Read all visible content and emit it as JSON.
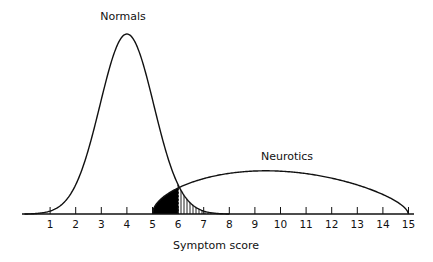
{
  "chart_data": {
    "type": "line",
    "title": "",
    "xlabel": "Symptom score",
    "ylabel": "",
    "xlim": [
      -1,
      15.2
    ],
    "ylim": [
      0,
      1
    ],
    "grid": false,
    "x_ticks": [
      1,
      2,
      3,
      4,
      5,
      6,
      7,
      8,
      9,
      10,
      11,
      12,
      13,
      14,
      15
    ],
    "x_tick_labels": [
      "1",
      "2",
      "3",
      "4",
      "5",
      "6",
      "7",
      "8",
      "9",
      "10",
      "11",
      "12",
      "13",
      "14",
      "15"
    ],
    "series": [
      {
        "name": "Normals",
        "shape": "bell",
        "mean": 4,
        "range": [
          0,
          8
        ],
        "peak": 1.0
      },
      {
        "name": "Neurotics",
        "shape": "flat arc",
        "mean": 10,
        "range": [
          5,
          15
        ],
        "peak": 0.24
      }
    ],
    "annotations": [
      {
        "text": "Normals",
        "attached_to": "Normals peak"
      },
      {
        "text": "Neurotics",
        "attached_to": "Neurotics curve"
      }
    ],
    "cutoff": 6,
    "shaded_regions": [
      {
        "name": "neurotics-below-cutoff",
        "from": 5,
        "to": 6,
        "fill": "solid black"
      },
      {
        "name": "normals-above-cutoff",
        "from": 6,
        "to": 8,
        "fill": "vertical hatching"
      }
    ]
  }
}
